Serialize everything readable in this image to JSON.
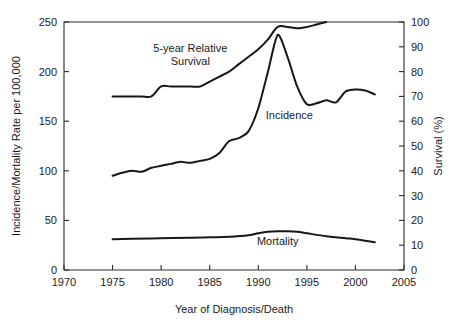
{
  "chart_data": {
    "type": "line",
    "title": "",
    "xlabel": "Year of Diagnosis/Death",
    "ylabel": "Incidence/Mortality Rate per 100,000",
    "y2label": "Survival (%)",
    "xlim": [
      1970,
      2005
    ],
    "ylim": [
      0,
      250
    ],
    "y2lim": [
      0,
      100
    ],
    "xticks": [
      1970,
      1975,
      1980,
      1985,
      1990,
      1995,
      2000,
      2005
    ],
    "xticklabels": [
      "1970",
      "1975",
      "1980",
      "1985",
      "1990",
      "1995",
      "2000",
      "2005"
    ],
    "yticks": [
      0,
      50,
      100,
      150,
      200,
      250
    ],
    "yticklabels": [
      "0",
      "50",
      "100",
      "150",
      "200",
      "250"
    ],
    "y2ticks": [
      0,
      10,
      20,
      30,
      40,
      50,
      60,
      70,
      80,
      90,
      100
    ],
    "y2ticklabels": [
      "0",
      "10",
      "20",
      "30",
      "40",
      "50",
      "60",
      "70",
      "80",
      "90",
      "100"
    ],
    "grid": false,
    "legend": "inline-annotations",
    "line_color": "#171717",
    "series": [
      {
        "name": "Incidence",
        "axis": "left",
        "units": "rate per 100,000",
        "annotation": "Incidence",
        "annotation_x": 1993.2,
        "annotation_y": 152,
        "x": [
          1975,
          1976,
          1977,
          1978,
          1979,
          1980,
          1981,
          1982,
          1983,
          1984,
          1985,
          1986,
          1987,
          1988,
          1989,
          1990,
          1991,
          1992,
          1993,
          1994,
          1995,
          1996,
          1997,
          1998,
          1999,
          2000,
          2001,
          2002
        ],
        "values": [
          95,
          98,
          100,
          99,
          103,
          105,
          107,
          109,
          108,
          110,
          112,
          118,
          130,
          133,
          140,
          163,
          200,
          237,
          215,
          185,
          167,
          168,
          171,
          169,
          180,
          182,
          181,
          177
        ]
      },
      {
        "name": "Mortality",
        "axis": "left",
        "units": "rate per 100,000",
        "annotation": "Mortality",
        "annotation_x": 1992.0,
        "annotation_y": 25,
        "x": [
          1975,
          1977,
          1980,
          1983,
          1985,
          1987,
          1989,
          1990,
          1991,
          1992,
          1993,
          1994,
          1995,
          1997,
          1999,
          2000,
          2002
        ],
        "values": [
          31,
          31.5,
          32,
          32.5,
          33,
          33.5,
          35,
          37,
          38.5,
          39,
          39,
          38.5,
          37,
          34,
          32,
          31,
          28
        ]
      },
      {
        "name": "5-year Relative Survival",
        "axis": "right",
        "units": "percent",
        "annotation": "5-year Relative\nSurvival",
        "annotation_line1": "5-year Relative",
        "annotation_line2": "Survival",
        "annotation_x": 1983.0,
        "annotation_y": 88,
        "x": [
          1975,
          1976,
          1977,
          1978,
          1979,
          1980,
          1981,
          1982,
          1983,
          1984,
          1985,
          1986,
          1987,
          1988,
          1989,
          1990,
          1991,
          1992,
          1993,
          1994,
          1995,
          1996,
          1997
        ],
        "values": [
          70,
          70,
          70,
          70,
          70,
          74,
          74,
          74,
          74,
          74,
          76,
          78,
          80,
          83,
          86,
          89,
          93,
          98,
          98,
          97.5,
          98,
          99,
          100
        ]
      }
    ]
  },
  "axes": {
    "x_title": "Year of Diagnosis/Death",
    "y_left_title": "Incidence/Mortality Rate per 100,000",
    "y_right_title": "Survival (%)"
  }
}
